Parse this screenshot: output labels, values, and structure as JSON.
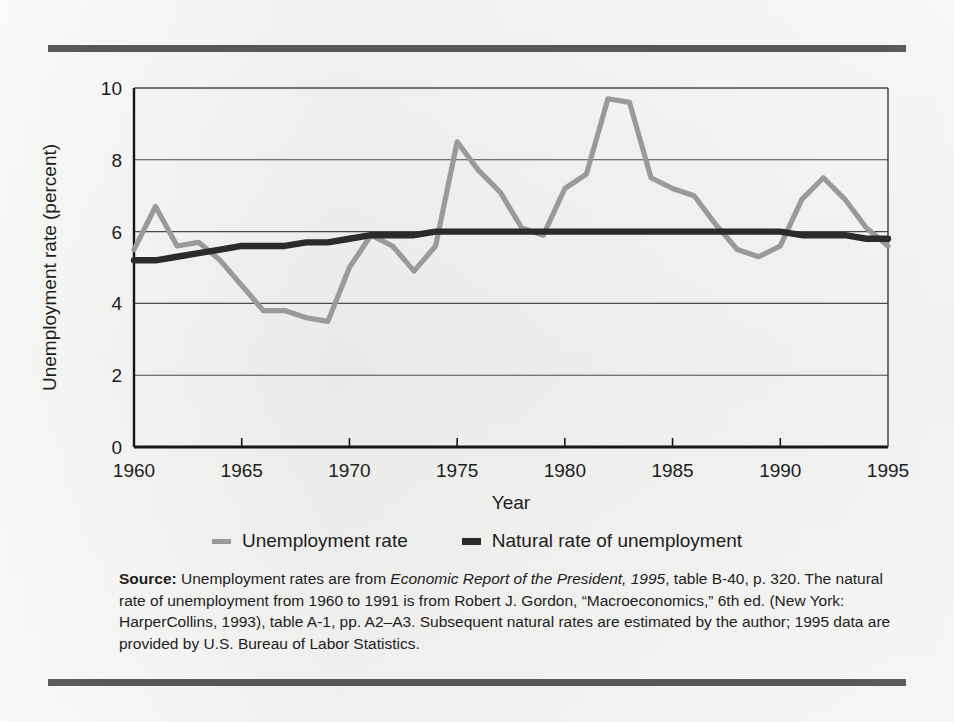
{
  "figure": {
    "background_color": "#eaeae8",
    "rule_color": "#575757"
  },
  "legend": {
    "items": [
      {
        "label": "Unemployment rate",
        "color": "#9a9a9a",
        "marker": "line-swatch"
      },
      {
        "label": "Natural rate of unemployment",
        "color": "#2b2b2b",
        "marker": "line-swatch"
      }
    ]
  },
  "source": {
    "prefix": "Source:",
    "seg1": " Unemployment rates are from ",
    "italic1": "Economic Report of the President, 1995",
    "seg2": ", table B-40, p. 320. The natural rate of unemployment from 1960 to 1991 is from Robert J. Gordon, “Macroeconomics,” 6th ed. (New York: HarperCollins, 1993), table A-1, pp. A2–A3. Subsequent natural rates are estimated by the author; 1995 data are provided by U.S. Bureau of Labor Statistics."
  },
  "chart_data": {
    "type": "line",
    "title": "",
    "xlabel": "Year",
    "ylabel": "Unemployment rate (percent)",
    "xlim": [
      1960,
      1995
    ],
    "ylim": [
      0,
      10
    ],
    "xticks": [
      1960,
      1965,
      1970,
      1975,
      1980,
      1985,
      1990,
      1995
    ],
    "yticks": [
      0,
      2,
      4,
      6,
      8,
      10
    ],
    "grid": "horizontal",
    "legend_position": "below-plot",
    "x": [
      1960,
      1961,
      1962,
      1963,
      1964,
      1965,
      1966,
      1967,
      1968,
      1969,
      1970,
      1971,
      1972,
      1973,
      1974,
      1975,
      1976,
      1977,
      1978,
      1979,
      1980,
      1981,
      1982,
      1983,
      1984,
      1985,
      1986,
      1987,
      1988,
      1989,
      1990,
      1991,
      1992,
      1993,
      1994,
      1995
    ],
    "series": [
      {
        "name": "Unemployment rate",
        "color": "#9a9a9a",
        "values": [
          5.5,
          6.7,
          5.6,
          5.7,
          5.2,
          4.5,
          3.8,
          3.8,
          3.6,
          3.5,
          5.0,
          5.9,
          5.6,
          4.9,
          5.6,
          8.5,
          7.7,
          7.1,
          6.1,
          5.9,
          7.2,
          7.6,
          9.7,
          9.6,
          7.5,
          7.2,
          7.0,
          6.2,
          5.5,
          5.3,
          5.6,
          6.9,
          7.5,
          6.9,
          6.1,
          5.6
        ]
      },
      {
        "name": "Natural rate of unemployment",
        "color": "#2b2b2b",
        "values": [
          5.2,
          5.2,
          5.3,
          5.4,
          5.5,
          5.6,
          5.6,
          5.6,
          5.7,
          5.7,
          5.8,
          5.9,
          5.9,
          5.9,
          6.0,
          6.0,
          6.0,
          6.0,
          6.0,
          6.0,
          6.0,
          6.0,
          6.0,
          6.0,
          6.0,
          6.0,
          6.0,
          6.0,
          6.0,
          6.0,
          6.0,
          5.9,
          5.9,
          5.9,
          5.8,
          5.8
        ]
      }
    ]
  }
}
